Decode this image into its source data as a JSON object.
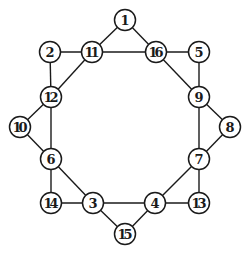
{
  "diagram": {
    "type": "undirected-graph",
    "node_radius": 10.5,
    "colors": {
      "stroke": "#1a1a1a",
      "fill": "#ffffff",
      "background": "#ffffff"
    },
    "nodes": [
      {
        "id": "1",
        "x": 125,
        "y": 20
      },
      {
        "id": "2",
        "x": 50,
        "y": 52
      },
      {
        "id": "11",
        "x": 92,
        "y": 52
      },
      {
        "id": "16",
        "x": 156,
        "y": 52
      },
      {
        "id": "5",
        "x": 199,
        "y": 52
      },
      {
        "id": "12",
        "x": 51,
        "y": 97
      },
      {
        "id": "9",
        "x": 199,
        "y": 97
      },
      {
        "id": "10",
        "x": 20,
        "y": 127
      },
      {
        "id": "8",
        "x": 230,
        "y": 127
      },
      {
        "id": "6",
        "x": 51,
        "y": 159
      },
      {
        "id": "7",
        "x": 199,
        "y": 159
      },
      {
        "id": "14",
        "x": 51,
        "y": 203
      },
      {
        "id": "3",
        "x": 93,
        "y": 203
      },
      {
        "id": "4",
        "x": 155,
        "y": 203
      },
      {
        "id": "13",
        "x": 199,
        "y": 203
      },
      {
        "id": "15",
        "x": 125,
        "y": 234
      }
    ],
    "edges": [
      [
        "1",
        "11"
      ],
      [
        "1",
        "16"
      ],
      [
        "2",
        "11"
      ],
      [
        "11",
        "16"
      ],
      [
        "16",
        "5"
      ],
      [
        "2",
        "12"
      ],
      [
        "11",
        "12"
      ],
      [
        "16",
        "9"
      ],
      [
        "5",
        "9"
      ],
      [
        "12",
        "10"
      ],
      [
        "12",
        "6"
      ],
      [
        "10",
        "6"
      ],
      [
        "9",
        "8"
      ],
      [
        "9",
        "7"
      ],
      [
        "8",
        "7"
      ],
      [
        "6",
        "14"
      ],
      [
        "6",
        "3"
      ],
      [
        "14",
        "3"
      ],
      [
        "7",
        "4"
      ],
      [
        "7",
        "13"
      ],
      [
        "4",
        "13"
      ],
      [
        "3",
        "4"
      ],
      [
        "3",
        "15"
      ],
      [
        "4",
        "15"
      ]
    ]
  }
}
